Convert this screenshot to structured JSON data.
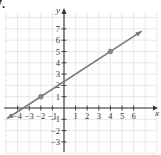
{
  "problem_label": "7.",
  "chart_data": {
    "type": "line",
    "title": "",
    "xlabel": "x",
    "ylabel": "y",
    "xlim": [
      -4.5,
      7
    ],
    "ylim": [
      -3.5,
      7.5
    ],
    "grid": true,
    "x_ticks": [
      -4,
      -3,
      -2,
      -1,
      1,
      2,
      3,
      4,
      5,
      6
    ],
    "y_ticks": [
      -3,
      -2,
      -1,
      1,
      2,
      3,
      4,
      5,
      6,
      7
    ],
    "x_tick_labels": [
      "−4",
      "−3",
      "−2",
      "−1",
      "1",
      "2",
      "3",
      "4",
      "5",
      "6"
    ],
    "y_tick_labels": [
      "−3",
      "−2",
      "−1",
      "1",
      "2",
      "3",
      "4",
      "5",
      "6",
      "7"
    ],
    "series": [
      {
        "name": "line",
        "equation": "y = (2/3)x + 7/3",
        "slope": 0.6667,
        "y_intercept": 2.333,
        "x_intercept": -3.5,
        "x": [
          -4.9,
          6.7
        ],
        "y": [
          -0.93,
          6.8
        ],
        "arrows": "both"
      }
    ],
    "points": [
      {
        "x": -2,
        "y": 1
      },
      {
        "x": 4,
        "y": 5
      }
    ],
    "colors": {
      "line": "#7a7a7a",
      "points": "#8a8a8a",
      "axes": "#333333",
      "grid": "#d8d8d8"
    }
  }
}
